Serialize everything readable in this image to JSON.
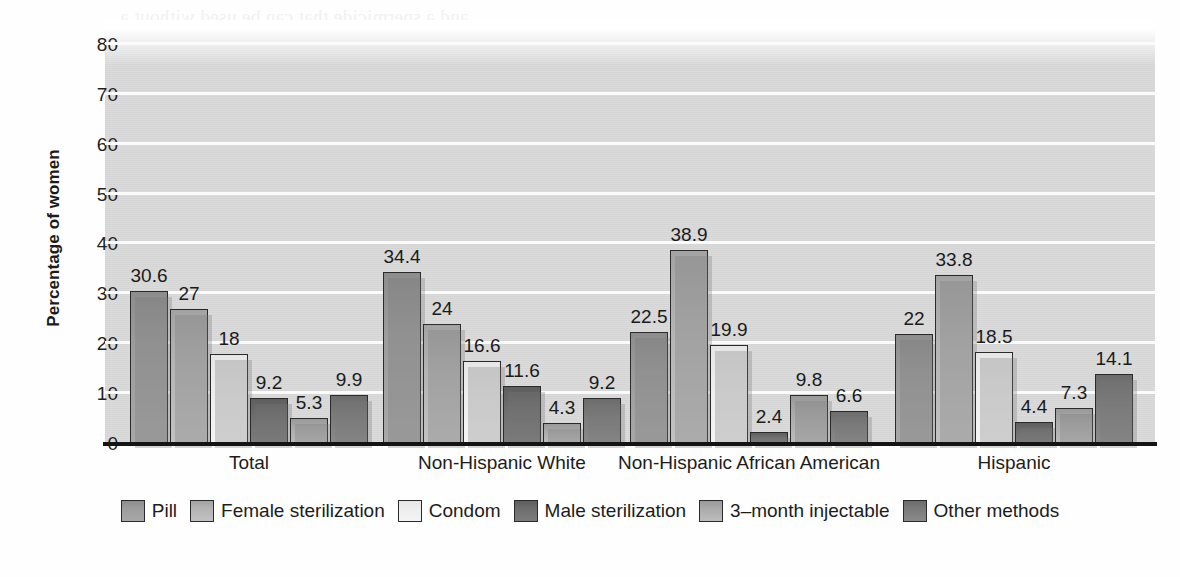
{
  "chart_data": {
    "type": "bar",
    "title": "",
    "xlabel": "",
    "ylabel": "Percentage of women",
    "ylim": [
      0,
      85
    ],
    "yticks": [
      0,
      10,
      20,
      30,
      40,
      50,
      60,
      70,
      80
    ],
    "grid": true,
    "legend_position": "bottom",
    "categories": [
      "Total",
      "Non-Hispanic White",
      "Non-Hispanic African American",
      "Hispanic"
    ],
    "series": [
      {
        "name": "Pill",
        "color": "#9c9c9c",
        "values": [
          30.6,
          34.4,
          22.5,
          22
        ]
      },
      {
        "name": "Female sterilization",
        "color": "#b4b4b4",
        "values": [
          27,
          24,
          38.9,
          33.8
        ]
      },
      {
        "name": "Condom",
        "color": "#eeeeee",
        "values": [
          18,
          16.6,
          19.9,
          18.5
        ]
      },
      {
        "name": "Male sterilization",
        "color": "#6e6e6e",
        "values": [
          9.2,
          11.6,
          2.4,
          4.4
        ]
      },
      {
        "name": "3–month injectable",
        "color": "#ababab",
        "values": [
          5.3,
          4.3,
          9.8,
          7.3
        ]
      },
      {
        "name": "Other methods",
        "color": "#7b7b7b",
        "values": [
          9.9,
          9.2,
          6.6,
          14.1
        ]
      }
    ],
    "value_labels": [
      [
        "30.6",
        "27",
        "18",
        "9.2",
        "5.3",
        "9.9"
      ],
      [
        "34.4",
        "24",
        "16.6",
        "11.6",
        "4.3",
        "9.2"
      ],
      [
        "22.5",
        "38.9",
        "19.9",
        "2.4",
        "9.8",
        "6.6"
      ],
      [
        "22",
        "33.8",
        "18.5",
        "4.4",
        "7.3",
        "14.1"
      ]
    ]
  },
  "legend": {
    "items": [
      {
        "label": "Pill"
      },
      {
        "label": "Female sterilization"
      },
      {
        "label": "Condom"
      },
      {
        "label": "Male sterilization"
      },
      {
        "label": "3–month injectable"
      },
      {
        "label": "Other methods"
      }
    ]
  },
  "background_artifacts": {
    "lines": [
      "and a spermicide that can be used without a",
      "prescription for up to 30 minutes before the period"
    ]
  }
}
